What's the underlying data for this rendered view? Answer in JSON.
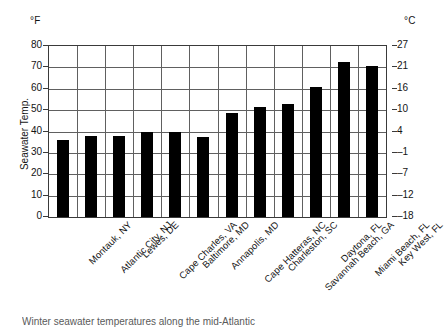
{
  "chart_data": {
    "type": "bar",
    "title": "",
    "xlabel": "",
    "ylabel": "Seawater Temp.",
    "unit_left": "°F",
    "unit_right": "°C",
    "ylim": [
      0,
      80
    ],
    "grid": true,
    "legend": "none",
    "bar_color": "#000000",
    "categories": [
      "Montauk, NY",
      "Atlantic City, NJ",
      "Lewes, DE",
      "Cape Charles, VA",
      "Baltimore, MD",
      "Annapolis, MD",
      "Cape Hatteras, NC",
      "Charleston, SC",
      "Savannah Beach, GA",
      "Daytona, FL",
      "Miami Beach, FL",
      "Key West, FL"
    ],
    "values": [
      36,
      38,
      38,
      40,
      40,
      37.5,
      48.5,
      51.5,
      53,
      61,
      72.5,
      70.5
    ],
    "yticks_left": [
      0,
      10,
      20,
      30,
      40,
      50,
      60,
      70,
      80
    ],
    "yticklabels_left": [
      "0",
      "10",
      "20",
      "30",
      "40",
      "50",
      "60",
      "70",
      "80"
    ],
    "yticks_right_positions": [
      0,
      10,
      20,
      30,
      40,
      50,
      60,
      70,
      80
    ],
    "yticklabels_right": [
      "–18",
      "–12",
      "–7",
      "–1",
      "4",
      "10",
      "16",
      "21",
      "27"
    ]
  },
  "caption": {
    "text": "Winter seawater temperatures along the mid-Atlantic"
  }
}
